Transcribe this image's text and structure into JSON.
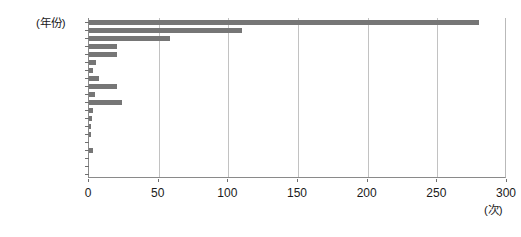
{
  "chart_data": {
    "type": "bar",
    "orientation": "horizontal",
    "title": "",
    "xlabel": "(次)",
    "ylabel": "(年份)",
    "xlim": [
      0,
      300
    ],
    "ylim": [
      0,
      20
    ],
    "grid": true,
    "legend": false,
    "bar_color": "#767676",
    "xticks": [
      0,
      50,
      100,
      150,
      200,
      250,
      300
    ],
    "xtick_labels": [
      "0",
      "50",
      "100",
      "150",
      "200",
      "250",
      "300"
    ],
    "ytick_labels": [
      "1700—1800",
      "1400—1500",
      "1100—1200",
      "800—900",
      "500—600",
      "200—300",
      "公元前100—0"
    ],
    "categories": [
      "1800—1900",
      "1700—1800",
      "1600—1700",
      "1500—1600",
      "1400—1500",
      "1300—1400",
      "1200—1300",
      "1100—1200",
      "1000—1100",
      "900—1000",
      "800—900",
      "700—800",
      "600—700",
      "500—600",
      "400—500",
      "300—400",
      "200—300",
      "100—200",
      "0—100",
      "公元前100—0"
    ],
    "values": [
      280,
      110,
      58,
      20,
      20,
      5,
      3,
      7,
      20,
      4,
      24,
      3,
      2,
      1,
      1,
      0,
      3,
      0,
      0,
      0
    ]
  }
}
